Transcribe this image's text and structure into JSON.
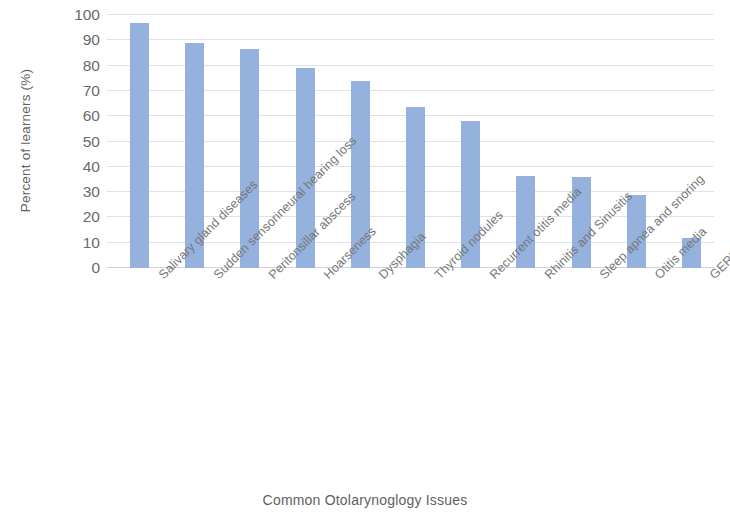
{
  "chart_data": {
    "type": "bar",
    "title": "",
    "xlabel": "Common Otolarynoglogy Issues",
    "ylabel": "Percent of learners (%)",
    "ylim": [
      0,
      100
    ],
    "ytick_step": 10,
    "yticks": [
      100,
      90,
      80,
      70,
      60,
      50,
      40,
      30,
      20,
      10,
      0
    ],
    "grid": true,
    "legend": "none",
    "bar_color": "#94b2dd",
    "gridline_color": "#d6dce8",
    "categories": [
      "Salivary gland diseases",
      "Sudden sensorineural hearing loss",
      "Peritonsillar abscess",
      "Hoarseness",
      "Dysphagia",
      "Thyroid nodules",
      "Recurrent otitis media",
      "Rhinitis and Sinusitis",
      "Sleep apnea and snoring",
      "Otitis media",
      "GERD"
    ],
    "values": [
      97,
      89,
      86.5,
      79,
      74,
      63.5,
      58,
      36.5,
      36,
      29,
      12
    ],
    "series": [
      {
        "name": "Percent of learners",
        "values": [
          97,
          89,
          86.5,
          79,
          74,
          63.5,
          58,
          36.5,
          36,
          29,
          12
        ]
      }
    ]
  }
}
